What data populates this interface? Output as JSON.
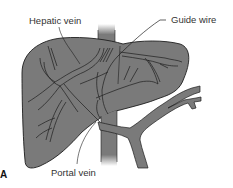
{
  "figure": {
    "panel_letter": "A",
    "labels": {
      "hepatic_vein": "Hepatic vein",
      "guide_wire": "Guide wire",
      "portal_vein": "Portal vein"
    },
    "colors": {
      "organ_fill": "#7a7a7a",
      "vessel_fill": "#7a7a7a",
      "outline": "#1e1e1e",
      "background": "#ffffff"
    }
  }
}
